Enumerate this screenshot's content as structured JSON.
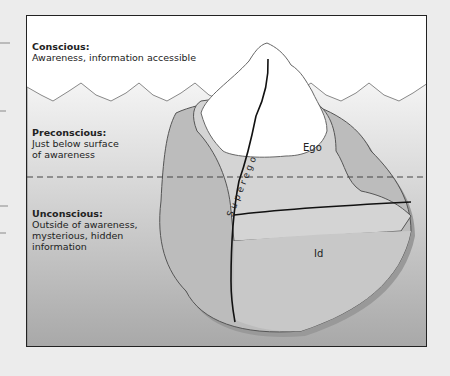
{
  "levels": [
    {
      "title": "Conscious:",
      "desc": "Awareness, information accessible"
    },
    {
      "title": "Preconscious:",
      "desc_lines": [
        "Just below surface",
        "of awareness"
      ]
    },
    {
      "title": "Unconscious:",
      "desc_lines": [
        "Outside of awareness,",
        "mysterious, hidden",
        "information"
      ]
    }
  ],
  "regions": {
    "ego": "Ego",
    "id": "Id",
    "superego": "Superego"
  },
  "colors": {
    "water_top": "#f2f2f2",
    "water_bottom": "#a9a9a9",
    "ice_light": "#d6d6d6",
    "ice_dark": "#bfbfbf",
    "outline": "#222222"
  }
}
